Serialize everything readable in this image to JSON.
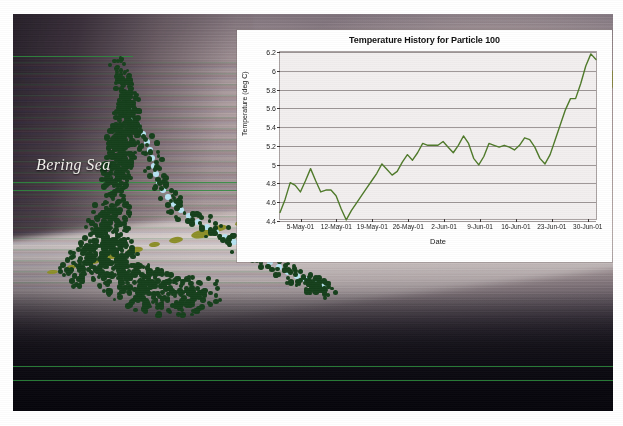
{
  "figure": {
    "name": "particle-track-map-with-temperature-inset",
    "map": {
      "region_label": "Bering Sea",
      "landmass_color": "#8d8f2a",
      "track_marker_color": "#16401c",
      "track_highlight_color": "#b7e4f2"
    }
  },
  "chart_data": {
    "type": "line",
    "title": "Temperature History for Particle 100",
    "xlabel": "Date",
    "ylabel": "Temperature (deg C)",
    "ylim": [
      4.4,
      6.2
    ],
    "yticks": [
      4.4,
      4.6,
      4.8,
      5.0,
      5.2,
      5.4,
      5.6,
      5.8,
      6.0,
      6.2
    ],
    "ytick_labels": [
      "4.4",
      "4.6",
      "4.8",
      "5",
      "5.2",
      "5.4",
      "5.6",
      "5.8",
      "6",
      "6.2"
    ],
    "xticks": [
      4,
      11,
      18,
      25,
      32,
      39,
      46,
      53,
      60
    ],
    "xtick_labels": [
      "5-May-01",
      "12-May-01",
      "19-May-01",
      "26-May-01",
      "2-Jun-01",
      "9-Jun-01",
      "16-Jun-01",
      "23-Jun-01",
      "30-Jun-01"
    ],
    "xlim": [
      0,
      62
    ],
    "grid": true,
    "legend": null,
    "line_color": "#4f7a2a",
    "series": [
      {
        "name": "Temperature",
        "x": [
          0,
          1,
          2,
          3,
          4,
          5,
          6,
          7,
          8,
          9,
          10,
          11,
          12,
          13,
          14,
          15,
          16,
          17,
          18,
          19,
          20,
          21,
          22,
          23,
          24,
          25,
          26,
          27,
          28,
          29,
          30,
          31,
          32,
          33,
          34,
          35,
          36,
          37,
          38,
          39,
          40,
          41,
          42,
          43,
          44,
          45,
          46,
          47,
          48,
          49,
          50,
          51,
          52,
          53,
          54,
          55,
          56,
          57,
          58,
          59,
          60,
          61,
          62
        ],
        "values": [
          4.48,
          4.62,
          4.8,
          4.77,
          4.7,
          4.82,
          4.95,
          4.82,
          4.7,
          4.72,
          4.72,
          4.66,
          4.52,
          4.4,
          4.5,
          4.58,
          4.66,
          4.74,
          4.82,
          4.9,
          5.0,
          4.94,
          4.88,
          4.92,
          5.02,
          5.1,
          5.04,
          5.12,
          5.22,
          5.2,
          5.2,
          5.2,
          5.24,
          5.18,
          5.12,
          5.2,
          5.3,
          5.22,
          5.06,
          4.99,
          5.08,
          5.22,
          5.2,
          5.18,
          5.2,
          5.18,
          5.15,
          5.2,
          5.28,
          5.26,
          5.18,
          5.06,
          5.0,
          5.1,
          5.26,
          5.42,
          5.58,
          5.7,
          5.7,
          5.86,
          6.05,
          6.18,
          6.12
        ]
      }
    ]
  }
}
